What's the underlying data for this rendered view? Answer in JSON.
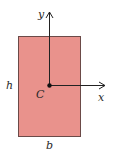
{
  "diagram": {
    "title": "",
    "shape": "rectangle cross-section",
    "colors": {
      "fill": "#E9928C",
      "stroke": "#6b4a48",
      "axis": "#222222",
      "background": "#ffffff"
    },
    "labels": {
      "y_axis": "y",
      "x_axis": "x",
      "centroid": "C",
      "height": "h",
      "width": "b"
    }
  }
}
